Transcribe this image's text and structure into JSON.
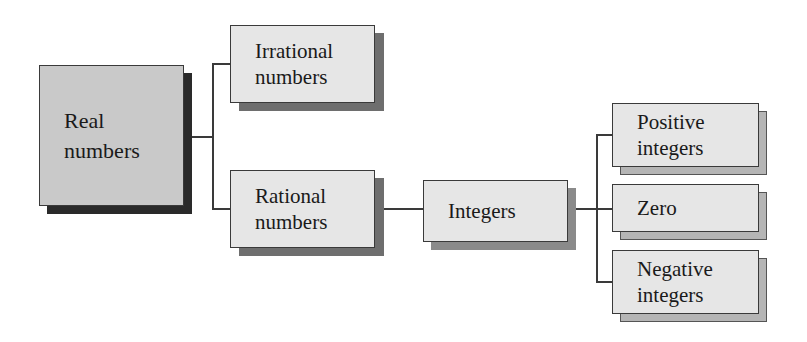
{
  "diagram": {
    "type": "hierarchy-tree",
    "colors": {
      "box_fill": "#e6e6e6",
      "root_fill": "#c9c9c9",
      "border": "#3a3a3a",
      "root_shadow": "#2a2a2a",
      "child_shadow": "#7a7a7a",
      "leaf_shadow": "#b5b5b5"
    },
    "nodes": {
      "real": {
        "label_1": "Real",
        "label_2": "numbers"
      },
      "irrational": {
        "label_1": "Irrational",
        "label_2": "numbers"
      },
      "rational": {
        "label_1": "Rational",
        "label_2": "numbers"
      },
      "integers": {
        "label_1": "Integers"
      },
      "positive": {
        "label_1": "Positive",
        "label_2": "integers"
      },
      "zero": {
        "label_1": "Zero"
      },
      "negative": {
        "label_1": "Negative",
        "label_2": "integers"
      }
    },
    "edges": [
      [
        "Real numbers",
        "Irrational numbers"
      ],
      [
        "Real numbers",
        "Rational numbers"
      ],
      [
        "Rational numbers",
        "Integers"
      ],
      [
        "Integers",
        "Positive integers"
      ],
      [
        "Integers",
        "Zero"
      ],
      [
        "Integers",
        "Negative integers"
      ]
    ]
  }
}
